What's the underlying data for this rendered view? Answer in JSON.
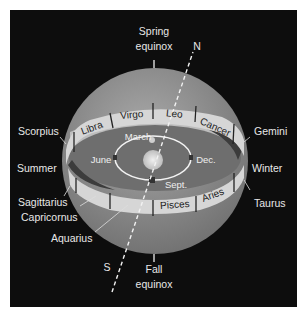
{
  "diagram": {
    "top_label": {
      "line1": "Spring",
      "line2": "equinox"
    },
    "bottom_label": {
      "line1": "Fall",
      "line2": "equinox"
    },
    "axis": {
      "north": "N",
      "south": "S"
    },
    "seasons": {
      "left": "Summer",
      "right": "Winter"
    },
    "orbit_months": {
      "top": "March",
      "left": "June",
      "right": "Dec.",
      "bottom": "Sept."
    },
    "band_front_upper": [
      "Libra",
      "Virgo",
      "Leo",
      "Cancer"
    ],
    "band_front_lower": [
      "Pisces",
      "Aries"
    ],
    "outer_labels_left": [
      "Scorpius",
      "Sagittarius",
      "Capricornus",
      "Aquarius"
    ],
    "outer_labels_right": [
      "Gemini",
      "Taurus"
    ],
    "colors": {
      "background": "#0d0d0d",
      "sphere": "#8a8a8a",
      "band": "#d6d6d6",
      "ecliptic_plane": "#6e6e6e",
      "text": "#e8e8e8"
    }
  }
}
